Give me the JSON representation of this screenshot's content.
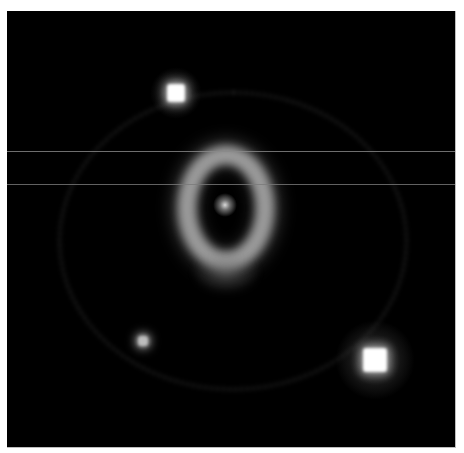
{
  "image": {
    "subject": "Supernova remnant with bright central ring, faint outer rings and two foreground stars",
    "background_color": "#000000",
    "frame_color": "#ffffff"
  },
  "features": {
    "central_ring": {
      "cx": 219,
      "cy": 197,
      "rx": 48,
      "ry": 62,
      "thickness": 18,
      "color": "#9a9a9a"
    },
    "central_source": {
      "cx": 218,
      "cy": 194,
      "r": 7,
      "color": "#d8d8d8"
    },
    "stars": [
      {
        "name": "upper-left-star",
        "cx": 169,
        "cy": 82,
        "r": 9,
        "halo": 26,
        "color": "#ffffff"
      },
      {
        "name": "lower-right-star",
        "cx": 368,
        "cy": 349,
        "r": 12,
        "halo": 40,
        "color": "#ffffff"
      },
      {
        "name": "faint-left-star",
        "cx": 136,
        "cy": 330,
        "r": 5,
        "halo": 10,
        "color": "#bdbdbd"
      }
    ],
    "outer_ring": {
      "cx": 226,
      "cy": 230,
      "rx": 175,
      "ry": 150,
      "color": "#2a2a2a"
    },
    "scanlines": [
      {
        "y": 140,
        "color": "#8a8a8a"
      },
      {
        "y": 173,
        "color": "#7a7a7a"
      }
    ]
  }
}
